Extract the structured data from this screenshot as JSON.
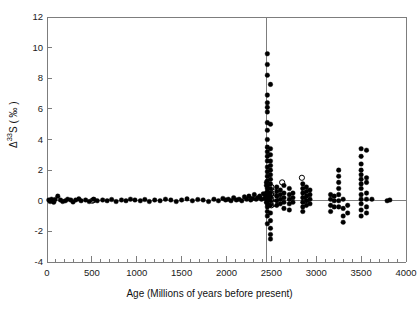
{
  "chart_data": {
    "type": "scatter",
    "title": "",
    "xlabel": "Age (Millions of years before present)",
    "ylabel_parts": {
      "delta": "Δ",
      "mass": "33",
      "element": "S",
      "units": "( ‰ )"
    },
    "ylabel": "Δ33S ( ‰ )",
    "xlim": [
      0,
      4000
    ],
    "ylim": [
      -4,
      12
    ],
    "xticks": [
      0,
      500,
      1000,
      1500,
      2000,
      2500,
      3000,
      3500,
      4000
    ],
    "xticklabels": [
      "0",
      "500",
      "1000",
      "1500",
      "2000",
      "2500",
      "3000",
      "3500",
      "4000"
    ],
    "xminor_step": 100,
    "yticks": [
      -4,
      -2,
      0,
      2,
      4,
      6,
      8,
      10,
      12
    ],
    "yticklabels": [
      "-4",
      "-2",
      "0",
      "2",
      "4",
      "6",
      "8",
      "10",
      "12"
    ],
    "grid": false,
    "legend_position": "none",
    "marker_color": "#000000",
    "frame_color": "#7d7d7d",
    "annotations": [
      {
        "name": "great-oxidation-event-divider",
        "type": "vline",
        "x": 2450,
        "color": "#7d7d7d"
      },
      {
        "name": "zero-reference-line",
        "type": "hline",
        "y": 0,
        "color": "#7d7d7d"
      }
    ],
    "series": [
      {
        "name": "Filled circles",
        "marker": "filled-circle",
        "points": [
          [
            20,
            0.05
          ],
          [
            35,
            -0.05
          ],
          [
            50,
            0.1
          ],
          [
            60,
            0.0
          ],
          [
            75,
            -0.1
          ],
          [
            90,
            0.08
          ],
          [
            120,
            0.3
          ],
          [
            150,
            0.05
          ],
          [
            175,
            -0.05
          ],
          [
            205,
            0.0
          ],
          [
            230,
            0.1
          ],
          [
            265,
            0.05
          ],
          [
            290,
            -0.08
          ],
          [
            320,
            0.05
          ],
          [
            355,
            0.12
          ],
          [
            380,
            0.0
          ],
          [
            430,
            0.05
          ],
          [
            470,
            -0.05
          ],
          [
            520,
            0.1
          ],
          [
            560,
            0.0
          ],
          [
            620,
            0.05
          ],
          [
            670,
            0.0
          ],
          [
            720,
            0.08
          ],
          [
            770,
            -0.05
          ],
          [
            830,
            0.05
          ],
          [
            880,
            0.0
          ],
          [
            930,
            0.1
          ],
          [
            980,
            0.05
          ],
          [
            1040,
            0.0
          ],
          [
            1090,
            0.08
          ],
          [
            1140,
            -0.05
          ],
          [
            1200,
            0.05
          ],
          [
            1260,
            0.0
          ],
          [
            1320,
            0.1
          ],
          [
            1380,
            0.05
          ],
          [
            1440,
            -0.05
          ],
          [
            1500,
            0.05
          ],
          [
            1560,
            0.12
          ],
          [
            1620,
            0.0
          ],
          [
            1680,
            0.08
          ],
          [
            1740,
            0.05
          ],
          [
            1800,
            -0.05
          ],
          [
            1860,
            0.1
          ],
          [
            1910,
            0.0
          ],
          [
            1960,
            0.15
          ],
          [
            1990,
            0.05
          ],
          [
            2020,
            0.1
          ],
          [
            2050,
            0.0
          ],
          [
            2080,
            0.2
          ],
          [
            2110,
            0.05
          ],
          [
            2140,
            0.1
          ],
          [
            2170,
            0.0
          ],
          [
            2200,
            0.25
          ],
          [
            2225,
            0.1
          ],
          [
            2250,
            0.3
          ],
          [
            2270,
            0.05
          ],
          [
            2290,
            0.15
          ],
          [
            2310,
            0.4
          ],
          [
            2330,
            0.1
          ],
          [
            2350,
            0.2
          ],
          [
            2370,
            0.3
          ],
          [
            2390,
            0.1
          ],
          [
            2410,
            0.45
          ],
          [
            2425,
            0.15
          ],
          [
            2440,
            0.3
          ],
          [
            2445,
            1.2
          ],
          [
            2455,
            9.6
          ],
          [
            2455,
            8.9
          ],
          [
            2455,
            8.2
          ],
          [
            2455,
            6.9
          ],
          [
            2455,
            6.4
          ],
          [
            2455,
            6.1
          ],
          [
            2455,
            5.8
          ],
          [
            2455,
            5.1
          ],
          [
            2455,
            4.6
          ],
          [
            2455,
            4.0
          ],
          [
            2455,
            3.5
          ],
          [
            2455,
            3.2
          ],
          [
            2455,
            2.9
          ],
          [
            2455,
            2.6
          ],
          [
            2455,
            2.2
          ],
          [
            2455,
            1.9
          ],
          [
            2455,
            1.6
          ],
          [
            2455,
            1.3
          ],
          [
            2455,
            1.0
          ],
          [
            2455,
            0.8
          ],
          [
            2455,
            0.6
          ],
          [
            2455,
            0.4
          ],
          [
            2455,
            0.2
          ],
          [
            2455,
            0.0
          ],
          [
            2455,
            -0.2
          ],
          [
            2455,
            -0.4
          ],
          [
            2455,
            -0.7
          ],
          [
            2455,
            -1.0
          ],
          [
            2455,
            -1.5
          ],
          [
            2445,
            1.0
          ],
          [
            2445,
            0.5
          ],
          [
            2445,
            0.2
          ],
          [
            2445,
            -0.1
          ],
          [
            2490,
            7.6
          ],
          [
            2490,
            5.0
          ],
          [
            2490,
            3.4
          ],
          [
            2490,
            3.0
          ],
          [
            2490,
            2.6
          ],
          [
            2490,
            2.3
          ],
          [
            2490,
            2.0
          ],
          [
            2490,
            1.7
          ],
          [
            2490,
            1.4
          ],
          [
            2490,
            1.1
          ],
          [
            2490,
            0.8
          ],
          [
            2490,
            0.5
          ],
          [
            2490,
            0.25
          ],
          [
            2490,
            0.0
          ],
          [
            2490,
            -0.3
          ],
          [
            2490,
            -0.8
          ],
          [
            2490,
            -1.3
          ],
          [
            2490,
            -1.8
          ],
          [
            2490,
            -2.2
          ],
          [
            2490,
            -2.5
          ],
          [
            2560,
            0.9
          ],
          [
            2560,
            0.6
          ],
          [
            2560,
            0.3
          ],
          [
            2560,
            0.0
          ],
          [
            2560,
            -0.3
          ],
          [
            2600,
            0.7
          ],
          [
            2600,
            0.4
          ],
          [
            2600,
            0.1
          ],
          [
            2600,
            -0.2
          ],
          [
            2640,
            1.0
          ],
          [
            2640,
            0.5
          ],
          [
            2640,
            0.2
          ],
          [
            2640,
            -0.1
          ],
          [
            2640,
            -0.5
          ],
          [
            2700,
            0.8
          ],
          [
            2700,
            0.4
          ],
          [
            2700,
            0.1
          ],
          [
            2700,
            -0.2
          ],
          [
            2700,
            -0.6
          ],
          [
            2740,
            0.5
          ],
          [
            2740,
            0.2
          ],
          [
            2740,
            -0.1
          ],
          [
            2850,
            1.1
          ],
          [
            2850,
            0.8
          ],
          [
            2850,
            0.5
          ],
          [
            2850,
            0.2
          ],
          [
            2850,
            -0.1
          ],
          [
            2850,
            -0.4
          ],
          [
            2850,
            -0.7
          ],
          [
            2890,
            0.9
          ],
          [
            2890,
            0.6
          ],
          [
            2890,
            0.3
          ],
          [
            2890,
            0.0
          ],
          [
            2890,
            -0.3
          ],
          [
            2930,
            0.7
          ],
          [
            2930,
            0.4
          ],
          [
            2930,
            0.1
          ],
          [
            2930,
            -0.2
          ],
          [
            3160,
            0.4
          ],
          [
            3160,
            0.1
          ],
          [
            3160,
            -0.3
          ],
          [
            3160,
            -0.7
          ],
          [
            3200,
            0.3
          ],
          [
            3200,
            0.0
          ],
          [
            3200,
            -0.4
          ],
          [
            3250,
            2.0
          ],
          [
            3250,
            1.6
          ],
          [
            3250,
            1.2
          ],
          [
            3250,
            0.8
          ],
          [
            3250,
            0.4
          ],
          [
            3250,
            0.0
          ],
          [
            3250,
            -0.4
          ],
          [
            3300,
            0.1
          ],
          [
            3300,
            -0.5
          ],
          [
            3300,
            -1.0
          ],
          [
            3300,
            -1.4
          ],
          [
            3350,
            -0.3
          ],
          [
            3350,
            -0.8
          ],
          [
            3500,
            3.4
          ],
          [
            3500,
            2.9
          ],
          [
            3500,
            2.4
          ],
          [
            3500,
            2.0
          ],
          [
            3500,
            1.7
          ],
          [
            3500,
            1.4
          ],
          [
            3500,
            1.1
          ],
          [
            3500,
            0.8
          ],
          [
            3500,
            0.4
          ],
          [
            3500,
            0.1
          ],
          [
            3500,
            -0.2
          ],
          [
            3500,
            -0.6
          ],
          [
            3500,
            -1.0
          ],
          [
            3560,
            3.3
          ],
          [
            3560,
            1.5
          ],
          [
            3560,
            1.2
          ],
          [
            3560,
            0.5
          ],
          [
            3560,
            0.1
          ],
          [
            3560,
            -0.4
          ],
          [
            3560,
            -0.8
          ],
          [
            3620,
            0.1
          ],
          [
            3790,
            0.0
          ],
          [
            3820,
            0.05
          ]
        ]
      },
      {
        "name": "Open circles",
        "marker": "open-circle",
        "points": [
          [
            505,
            0.0
          ],
          [
            520,
            0.05
          ],
          [
            2500,
            0.9
          ],
          [
            2500,
            0.5
          ],
          [
            2500,
            0.1
          ],
          [
            2500,
            -0.3
          ],
          [
            2540,
            0.6
          ],
          [
            2540,
            0.2
          ],
          [
            2540,
            -0.2
          ],
          [
            2620,
            1.2
          ],
          [
            2840,
            1.5
          ],
          [
            2870,
            0.7
          ],
          [
            2870,
            0.3
          ],
          [
            2870,
            0.0
          ],
          [
            2905,
            0.5
          ],
          [
            2905,
            0.1
          ]
        ]
      }
    ]
  },
  "axes": {
    "x_title": "Age (Millions of years before present)",
    "y_title": "Δ33S ( ‰ )"
  }
}
